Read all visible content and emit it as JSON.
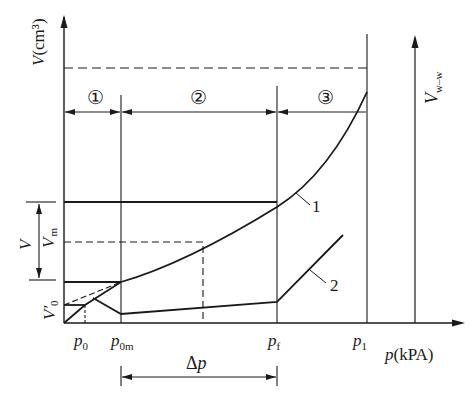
{
  "diagram": {
    "type": "pressure-volume curve diagram",
    "y_axis_label": "V(cm³)",
    "y_axis_var": "V",
    "y_axis_unit": "(cm³)",
    "x_axis_label": "p(kPA)",
    "x_axis_var": "p",
    "x_axis_unit": "(kPA)",
    "right_axis_label": "V",
    "right_axis_sub": "w–w",
    "regions": [
      {
        "id": "region-1",
        "label": "①"
      },
      {
        "id": "region-2",
        "label": "②"
      },
      {
        "id": "region-3",
        "label": "③"
      }
    ],
    "x_ticks": [
      {
        "var": "p",
        "sub": "0"
      },
      {
        "var": "p",
        "sub": "0m"
      },
      {
        "var": "p",
        "sub": "f"
      },
      {
        "var": "p",
        "sub": "1"
      }
    ],
    "y_labels": {
      "V": "V",
      "Vm_var": "V",
      "Vm_sub": "m",
      "V0_var": "V′",
      "V0_sub": "0"
    },
    "curve_labels": [
      "1",
      "2"
    ],
    "delta_p_label": "Δp",
    "delta_p_var": "p",
    "delta_p_sym": "Δ"
  }
}
